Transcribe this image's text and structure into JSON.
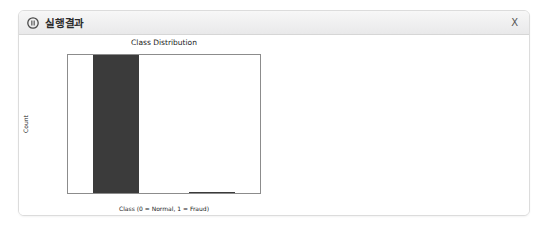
{
  "window": {
    "title": "실행결과",
    "icon": "media-circle-icon",
    "close_label": "X"
  },
  "chart_data": {
    "type": "bar",
    "title": "Class Distribution",
    "xlabel": "Class (0 = Normal, 1 = Fraud)",
    "ylabel": "Count",
    "categories": [
      "0",
      "1"
    ],
    "values": [
      284315,
      492
    ],
    "ylim": [
      0,
      284315
    ],
    "yticks": [
      0,
      50000,
      100000,
      150000,
      200000,
      250000
    ],
    "ytick_labels": [
      "0",
      "50000",
      "100000",
      "150000",
      "200000",
      "250000"
    ],
    "xticks": [
      0,
      1
    ],
    "xtick_labels": [
      "0",
      "1"
    ],
    "grid": false,
    "legend": "none",
    "bar_color": "#3b3b3b"
  }
}
